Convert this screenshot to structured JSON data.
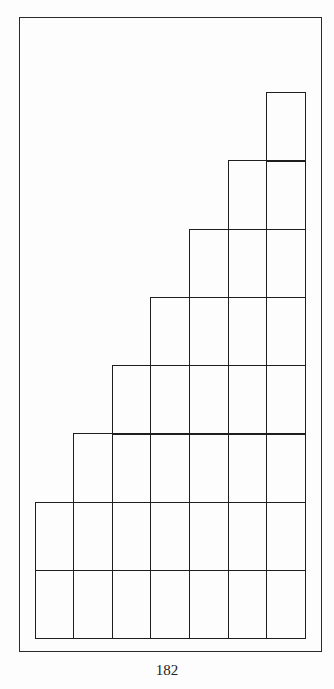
{
  "page": {
    "page_number": "182"
  },
  "diagram": {
    "type": "staircase-grid",
    "columns": 7,
    "column_heights": [
      2,
      3,
      4,
      5,
      6,
      7,
      8
    ],
    "column_x": [
      35,
      73,
      112,
      150,
      189,
      228,
      266,
      305
    ],
    "row_y_bottom": 638,
    "row_height": 68.25,
    "line_color": "#1e1e1e"
  }
}
